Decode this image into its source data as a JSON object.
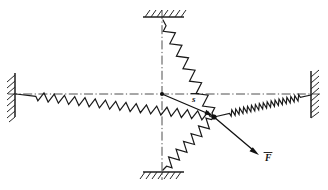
{
  "figure": {
    "background_color": "#ffffff",
    "ink_color": "#1a1a1a",
    "axis_color": "#3a3a3a",
    "labels": {
      "displacement": "s",
      "force": "F"
    },
    "supports": [
      {
        "name": "left-wall",
        "orientation": "vertical",
        "hatch_side": "left",
        "x": 15,
        "y1": 73,
        "y2": 117
      },
      {
        "name": "right-wall",
        "orientation": "vertical",
        "hatch_side": "right",
        "x": 311,
        "y1": 71,
        "y2": 118
      },
      {
        "name": "top-wall",
        "orientation": "horizontal",
        "hatch_side": "above",
        "y": 17,
        "x1": 143,
        "x2": 184
      },
      {
        "name": "bottom-wall",
        "orientation": "horizontal",
        "hatch_side": "below",
        "y": 172,
        "x1": 143,
        "x2": 184
      }
    ],
    "axes": [
      {
        "name": "horizontal-centerline",
        "x1": 8,
        "y1": 94,
        "x2": 320,
        "y2": 94
      },
      {
        "name": "vertical-centerline",
        "x1": 162,
        "y1": 10,
        "x2": 162,
        "y2": 180
      }
    ],
    "origin": {
      "name": "origin-node",
      "x": 162,
      "y": 94
    },
    "junction": {
      "name": "junction-node",
      "x": 214,
      "y": 117
    },
    "springs": [
      {
        "name": "spring-left",
        "from_x": 16,
        "from_y": 94,
        "to_x": 214,
        "to_y": 117,
        "coils": 17,
        "amplitude": 8.5,
        "lead_in": 0.1,
        "lead_out": 0.02
      },
      {
        "name": "spring-right",
        "from_x": 214,
        "from_y": 117,
        "to_x": 311,
        "to_y": 95,
        "coils": 18,
        "amplitude": 6.0,
        "lead_in": 0.16,
        "lead_out": 0.11
      },
      {
        "name": "spring-top",
        "from_x": 163,
        "from_y": 20,
        "to_x": 214,
        "to_y": 117,
        "coils": 7,
        "amplitude": 10.0,
        "lead_in": 0.06,
        "lead_out": 0.04
      },
      {
        "name": "spring-bottom",
        "from_x": 163,
        "from_y": 170,
        "to_x": 214,
        "to_y": 117,
        "coils": 6,
        "amplitude": 10.0,
        "lead_in": 0.07,
        "lead_out": 0.05
      }
    ],
    "vectors": [
      {
        "name": "displacement-vector",
        "label": "s",
        "from_x": 162,
        "from_y": 94,
        "to_x": 213,
        "to_y": 116,
        "label_x": 192,
        "label_y": 101
      },
      {
        "name": "force-vector",
        "label": "F",
        "from_x": 214,
        "from_y": 117,
        "to_x": 258,
        "to_y": 154,
        "label_x": 266,
        "label_y": 160
      }
    ]
  }
}
